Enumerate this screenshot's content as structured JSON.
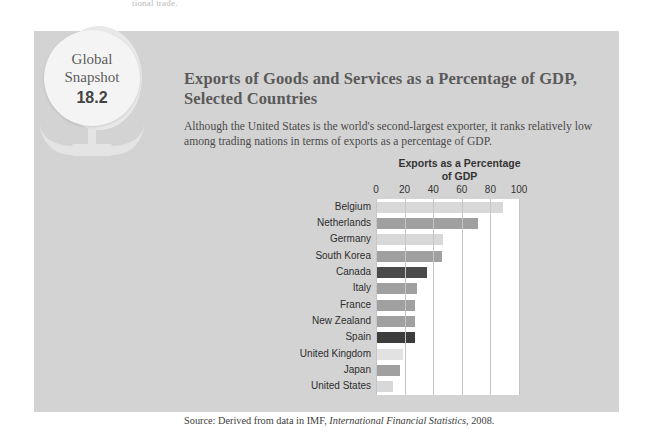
{
  "page_fragment": "tional trade.",
  "badge": {
    "line1": "Global",
    "line2": "Snapshot",
    "number": "18.2",
    "icon": "globe-icon"
  },
  "header": {
    "title": "Exports of Goods and Services as a Percentage of GDP, Selected Countries",
    "subtitle": "Although the United States is the world's second-largest exporter, it ranks relatively low among trading nations in terms of exports as a percentage of GDP."
  },
  "source": {
    "prefix": "Source: Derived from data in IMF, ",
    "italic": "International Financial Statistics",
    "suffix": ", 2008."
  },
  "colors": {
    "panel_background": "#d3d3d3",
    "plot_background": "#ffffff",
    "gridline": "#c6c6c6",
    "bar_light": "#d8d8d8",
    "bar_medium": "#a0a0a0",
    "bar_dark": "#4a4a4a",
    "bar_pale": "#e2e2e2",
    "title_text": "#5a5a5a"
  },
  "chart_data": {
    "type": "bar",
    "orientation": "horizontal",
    "title": "Exports as a Percentage of GDP",
    "title_line1": "Exports as a Percentage",
    "title_line2": "of GDP",
    "xlabel": "",
    "ylabel": "",
    "xlim": [
      0,
      100
    ],
    "xticks": [
      0,
      20,
      40,
      60,
      80,
      100
    ],
    "xtick_labels": [
      "0",
      "20",
      "40",
      "60",
      "80",
      "100"
    ],
    "grid": true,
    "legend": "none",
    "categories": [
      "Belgium",
      "Netherlands",
      "Germany",
      "South Korea",
      "Canada",
      "Italy",
      "France",
      "New Zealand",
      "Spain",
      "United Kingdom",
      "Japan",
      "United States"
    ],
    "values": [
      89,
      71,
      47,
      46,
      36,
      29,
      27,
      27,
      27,
      19,
      17,
      12
    ],
    "bar_colors": [
      "#d8d8d8",
      "#a0a0a0",
      "#d8d8d8",
      "#a0a0a0",
      "#4a4a4a",
      "#a0a0a0",
      "#a0a0a0",
      "#a0a0a0",
      "#3d3d3d",
      "#e2e2e2",
      "#a0a0a0",
      "#d8d8d8"
    ]
  }
}
